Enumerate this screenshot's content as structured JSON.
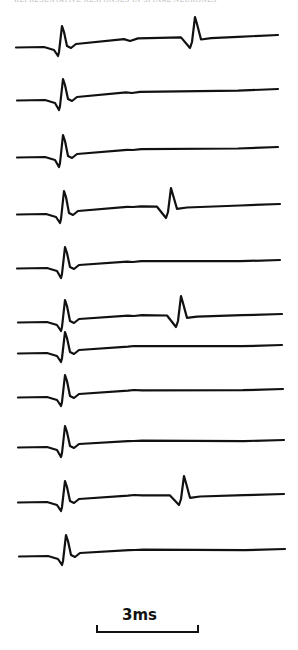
{
  "figure": {
    "header_text": "REPRESENTATIVE RESPONSES IN SPINAL NEURONES",
    "scale_bar": {
      "label": "3ms",
      "x1": 97,
      "x2": 198,
      "y": 632,
      "tick_top": 625
    },
    "trace_color": "#111111",
    "background": "#ffffff"
  },
  "chart_data": {
    "type": "line",
    "title": "",
    "xlabel": "",
    "ylabel": "",
    "grid": false,
    "annotations": [
      "3ms scale bar"
    ],
    "traces": [
      {
        "index": 1,
        "x0": 16,
        "x1": 278,
        "base": 47,
        "end": 35,
        "spike1": {
          "x": 58,
          "dip": 56,
          "peak": 26
        },
        "bump": {
          "x": 130,
          "y": 41
        },
        "spike2": {
          "x": 191,
          "dip": 48,
          "peak": 17
        }
      },
      {
        "index": 2,
        "x0": 17,
        "x1": 278,
        "base": 100,
        "end": 89,
        "spike1": {
          "x": 59,
          "dip": 110,
          "peak": 79
        },
        "bump": {
          "x": 132,
          "y": 93
        },
        "spike2": null
      },
      {
        "index": 3,
        "x0": 17,
        "x1": 278,
        "base": 157,
        "end": 147,
        "spike1": {
          "x": 59,
          "dip": 167,
          "peak": 135
        },
        "bump": {
          "x": 133,
          "y": 150
        },
        "spike2": null
      },
      {
        "index": 4,
        "x0": 17,
        "x1": 280,
        "base": 214,
        "end": 204,
        "spike1": {
          "x": 60,
          "dip": 223,
          "peak": 191
        },
        "bump": {
          "x": 133,
          "y": 207
        },
        "spike2": {
          "x": 167,
          "dip": 218,
          "peak": 188
        }
      },
      {
        "index": 5,
        "x0": 17,
        "x1": 280,
        "base": 268,
        "end": 260,
        "spike1": {
          "x": 61,
          "dip": 278,
          "peak": 247
        },
        "bump": {
          "x": 133,
          "y": 262
        },
        "spike2": null
      },
      {
        "index": 6,
        "x0": 18,
        "x1": 282,
        "base": 322,
        "end": 314,
        "spike1": {
          "x": 61,
          "dip": 331,
          "peak": 300
        },
        "bump": {
          "x": 134,
          "y": 316
        },
        "spike2": {
          "x": 177,
          "dip": 327,
          "peak": 296
        }
      },
      {
        "index": 7,
        "x0": 18,
        "x1": 282,
        "base": 353,
        "end": 345,
        "spike1": {
          "x": 61,
          "dip": 362,
          "peak": 332
        },
        "bump": {
          "x": 134,
          "y": 346
        },
        "spike2": null
      },
      {
        "index": 8,
        "x0": 18,
        "x1": 283,
        "base": 397,
        "end": 389,
        "spike1": {
          "x": 61,
          "dip": 406,
          "peak": 375
        },
        "bump": {
          "x": 134,
          "y": 390
        },
        "spike2": null
      },
      {
        "index": 9,
        "x0": 18,
        "x1": 284,
        "base": 447,
        "end": 440,
        "spike1": {
          "x": 61,
          "dip": 457,
          "peak": 426
        },
        "bump": {
          "x": 134,
          "y": 441
        },
        "spike2": null
      },
      {
        "index": 10,
        "x0": 18,
        "x1": 284,
        "base": 502,
        "end": 494,
        "spike1": {
          "x": 61,
          "dip": 511,
          "peak": 481
        },
        "bump": {
          "x": 134,
          "y": 495
        },
        "spike2": {
          "x": 180,
          "dip": 505,
          "peak": 476
        }
      },
      {
        "index": 11,
        "x0": 19,
        "x1": 285,
        "base": 556,
        "end": 549,
        "spike1": {
          "x": 62,
          "dip": 565,
          "peak": 535
        },
        "bump": {
          "x": 135,
          "y": 550
        },
        "spike2": null
      }
    ]
  }
}
